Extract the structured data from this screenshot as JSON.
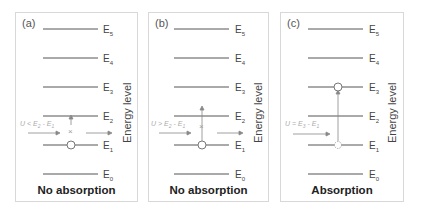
{
  "panels": [
    {
      "id": "a",
      "tag": "(a)",
      "caption": "No absorption",
      "axis_label": "Energy level",
      "condition": "U < E2 - E1",
      "levels": [
        "E5",
        "E4",
        "E3",
        "E2",
        "E1",
        "E0"
      ],
      "electron_level": "E1",
      "transition": "blocked"
    },
    {
      "id": "b",
      "tag": "(b)",
      "caption": "No absorption",
      "axis_label": "Energy level",
      "condition": "U > E2 - E1",
      "levels": [
        "E5",
        "E4",
        "E3",
        "E2",
        "E1",
        "E0"
      ],
      "electron_level": "E1",
      "transition": "blocked"
    },
    {
      "id": "c",
      "tag": "(c)",
      "caption": "Absorption",
      "axis_label": "Energy level",
      "condition": "U = E3 - E1",
      "levels": [
        "E5",
        "E4",
        "E3",
        "E2",
        "E1",
        "E0"
      ],
      "electron_level": "E1",
      "target_level": "E3",
      "transition": "absorbed"
    }
  ],
  "colors": {
    "line": "#555555",
    "arrow": "#777777",
    "condition_text": "#aaaaaa",
    "border": "#d8d8d8"
  }
}
